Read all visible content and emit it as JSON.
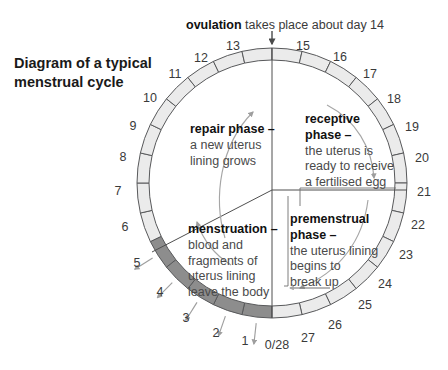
{
  "title": "Diagram of a typical\nmenstrual cycle",
  "ovulation": {
    "bold": "ovulation",
    "rest": " takes place about day 14"
  },
  "phases": {
    "repair": {
      "title": "repair phase –",
      "body": "a new uterus\nlining grows"
    },
    "receptive": {
      "title": "receptive\nphase –",
      "body": "the uterus is\nready to receive\na fertilised egg"
    },
    "premenstrual": {
      "title": "premenstrual\nphase –",
      "body": "the uterus lining\nbegins to\nbreak up"
    },
    "menstruation": {
      "title": "menstruation –",
      "body": "blood and\nfragments of\nuterus lining\nleave the body"
    }
  },
  "day_labels": [
    {
      "day": "0/28",
      "x": 277,
      "y": 345
    },
    {
      "day": "1",
      "x": 245,
      "y": 341
    },
    {
      "day": "2",
      "x": 216,
      "y": 333
    },
    {
      "day": "3",
      "x": 186,
      "y": 318
    },
    {
      "day": "4",
      "x": 160,
      "y": 292
    },
    {
      "day": "5",
      "x": 137,
      "y": 263
    },
    {
      "day": "6",
      "x": 125,
      "y": 227
    },
    {
      "day": "7",
      "x": 118,
      "y": 191
    },
    {
      "day": "8",
      "x": 123,
      "y": 157
    },
    {
      "day": "9",
      "x": 133,
      "y": 126
    },
    {
      "day": "10",
      "x": 150,
      "y": 98
    },
    {
      "day": "11",
      "x": 175,
      "y": 74
    },
    {
      "day": "12",
      "x": 201,
      "y": 58
    },
    {
      "day": "13",
      "x": 233,
      "y": 46
    },
    {
      "day": "15",
      "x": 303,
      "y": 46
    },
    {
      "day": "16",
      "x": 340,
      "y": 57
    },
    {
      "day": "17",
      "x": 370,
      "y": 74
    },
    {
      "day": "18",
      "x": 394,
      "y": 99
    },
    {
      "day": "19",
      "x": 412,
      "y": 127
    },
    {
      "day": "20",
      "x": 422,
      "y": 158
    },
    {
      "day": "21",
      "x": 424,
      "y": 192
    },
    {
      "day": "22",
      "x": 418,
      "y": 225
    },
    {
      "day": "23",
      "x": 406,
      "y": 255
    },
    {
      "day": "24",
      "x": 385,
      "y": 284
    },
    {
      "day": "25",
      "x": 365,
      "y": 305
    },
    {
      "day": "26",
      "x": 335,
      "y": 325
    },
    {
      "day": "27",
      "x": 308,
      "y": 338
    }
  ],
  "chart_data": {
    "type": "pie",
    "title": "Diagram of a typical menstrual cycle",
    "total_days": 28,
    "segments_count": 28,
    "ring_shading": {
      "menstruation_days": [
        1,
        2,
        3,
        4,
        5
      ],
      "menstruation_color": "#8d8d8d",
      "other_color": "#ebebeb",
      "outline_color": "#58595b"
    },
    "phase_boundaries_days": [
      5,
      14,
      21,
      28
    ],
    "phases": [
      {
        "name": "menstruation",
        "days": "1–5"
      },
      {
        "name": "repair phase",
        "days": "6–14"
      },
      {
        "name": "receptive phase",
        "days": "15–21"
      },
      {
        "name": "premenstrual phase",
        "days": "22–28"
      }
    ],
    "ovulation_day": 14,
    "geometry": {
      "cx": 272,
      "cy": 183,
      "r_outer": 135,
      "r_inner": 123
    }
  },
  "colors": {
    "ink": "#231f20",
    "segment_light": "#ebebeb",
    "segment_dark": "#8d8d8d",
    "stroke": "#58595b",
    "arrow_grey": "#9a9a9a"
  }
}
